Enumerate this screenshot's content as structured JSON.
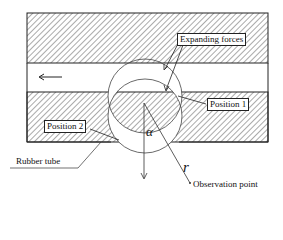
{
  "diagram": {
    "labels": {
      "expanding_forces": "Expanding forces",
      "position_1": "Position 1",
      "position_2": "Position 2",
      "rubber_tube": "Rubber tube",
      "observation_point": "Observation point",
      "alpha": "α",
      "r": "r"
    },
    "icons": {
      "flow_arrow": "←"
    },
    "colors": {
      "line": "#222222",
      "hatch": "#444444",
      "background": "#ffffff"
    }
  }
}
